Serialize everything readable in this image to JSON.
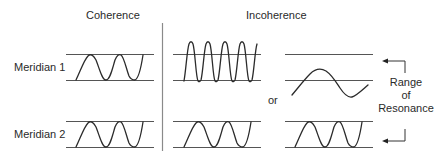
{
  "headers": {
    "coherence": "Coherence",
    "incoherence": "Incoherence"
  },
  "rows": {
    "meridian1": "Meridian 1",
    "meridian2": "Meridian 2"
  },
  "connector": "or",
  "range_label": {
    "line1": "Range",
    "line2": "of",
    "line3": "Resonance"
  },
  "colors": {
    "stroke": "#2b2b2b",
    "reference_line": "#555555",
    "divider": "#8a8a8a",
    "text": "#2a2a2a"
  },
  "panels": [
    {
      "id": "coherence-m1",
      "description": "two-cycle wave fitting between reference lines"
    },
    {
      "id": "incoherence-m1-a",
      "description": "high-frequency wave exceeding upper reference line"
    },
    {
      "id": "incoherence-m1-b",
      "description": "low-frequency wave, single cycle, below range"
    },
    {
      "id": "coherence-m2",
      "description": "two-cycle wave fitting between reference lines"
    },
    {
      "id": "incoherence-m2-a",
      "description": "two-cycle wave fitting between reference lines"
    },
    {
      "id": "incoherence-m2-b",
      "description": "two-cycle wave fitting between reference lines"
    }
  ]
}
